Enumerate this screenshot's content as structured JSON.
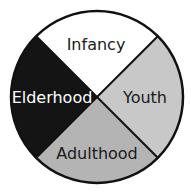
{
  "diagram": {
    "type": "four-quadrant circle",
    "segments": [
      {
        "label": "Infancy",
        "position": "top",
        "fill": "#ffffff",
        "text_color": "#1a1a1a"
      },
      {
        "label": "Youth",
        "position": "right",
        "fill": "#c8c8c8",
        "text_color": "#1a1a1a"
      },
      {
        "label": "Adulthood",
        "position": "bottom",
        "fill": "#b4b4b4",
        "text_color": "#1a1a1a"
      },
      {
        "label": "Elderhood",
        "position": "left",
        "fill": "#141414",
        "text_color": "#ffffff"
      }
    ],
    "outline_color": "#111111"
  }
}
